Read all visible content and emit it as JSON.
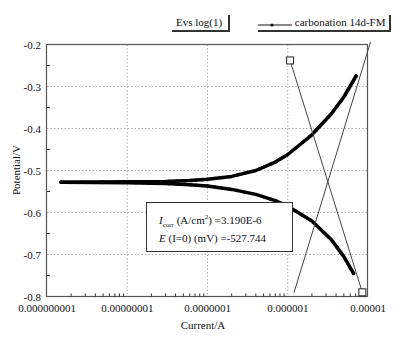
{
  "chart_data": {
    "type": "line",
    "xlabel": "Current/A",
    "ylabel": "Potential/V",
    "xscale": "log",
    "xlim": [
      1e-09,
      1e-05
    ],
    "ylim": [
      -0.8,
      -0.2
    ],
    "grid": true,
    "x_ticks": [
      1e-09,
      1e-08,
      1e-07,
      1e-06,
      1e-05
    ],
    "x_tick_labels": [
      "0.000000001",
      "0.00000001",
      "0.0000001",
      "0.000001",
      "0.00001"
    ],
    "y_ticks": [
      -0.2,
      -0.3,
      -0.4,
      -0.5,
      -0.6,
      -0.7,
      -0.8
    ],
    "y_tick_labels": [
      "-0.2",
      "-0.3",
      "-0.4",
      "-0.5",
      "-0.6",
      "-0.7",
      "-0.8"
    ],
    "legend": {
      "label": "carbonation 14d-FM",
      "placement": "top-right"
    },
    "title_box_label": "Evs log(1)",
    "series": [
      {
        "name": "carbonation 14d-FM anodic branch",
        "x": [
          1.5e-09,
          1e-08,
          3e-08,
          6e-08,
          1e-07,
          2e-07,
          4e-07,
          7e-07,
          1e-06,
          2e-06,
          3.5e-06,
          5e-06,
          7.1e-06
        ],
        "y": [
          -0.528,
          -0.527,
          -0.526,
          -0.524,
          -0.521,
          -0.514,
          -0.5,
          -0.48,
          -0.462,
          -0.415,
          -0.365,
          -0.325,
          -0.275
        ]
      },
      {
        "name": "carbonation 14d-FM cathodic branch",
        "x": [
          1.5e-09,
          1e-08,
          3e-08,
          6e-08,
          1e-07,
          2e-07,
          4e-07,
          7e-07,
          1e-06,
          2e-06,
          3.5e-06,
          5e-06,
          6.6e-06
        ],
        "y": [
          -0.528,
          -0.529,
          -0.531,
          -0.534,
          -0.537,
          -0.545,
          -0.557,
          -0.572,
          -0.585,
          -0.62,
          -0.665,
          -0.705,
          -0.745
        ]
      },
      {
        "name": "Tafel fit anodic",
        "x": [
          1.2e-06,
          1.07e-05
        ],
        "y": [
          -0.79,
          -0.195
        ]
      },
      {
        "name": "Tafel fit cathodic",
        "x": [
          1.07e-06,
          8.5e-06
        ],
        "y": [
          -0.238,
          -0.79
        ]
      }
    ],
    "markers": [
      {
        "shape": "square",
        "x": 1.07e-06,
        "y": -0.238
      },
      {
        "shape": "square",
        "x": 8.5e-06,
        "y": -0.79
      }
    ],
    "annotation": {
      "icorr_label": "I",
      "icorr_sub": "corr",
      "icorr_units": " (A/cm",
      "icorr_sup": "2",
      "icorr_value": ") =3.190E-6",
      "e_label": "E",
      "e_rest": " (I=0) (mV) =-527.744"
    }
  }
}
